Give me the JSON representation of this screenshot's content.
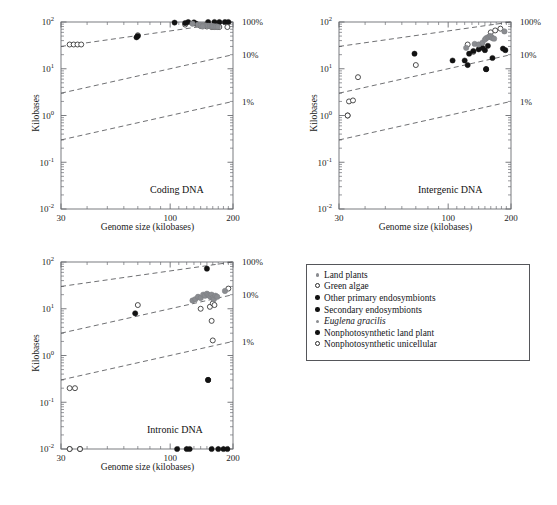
{
  "figure": {
    "background": "#ffffff",
    "axis_color": "#6b6d72",
    "text_color": "#1c1c1c"
  },
  "common": {
    "xlabel": "Genome size (kilobases)",
    "ylabel": "Kilobases",
    "x_ticks": [
      "30",
      "100",
      "200"
    ],
    "x_tick_values": [
      30,
      100,
      200
    ],
    "y_ticks": [
      "10-2",
      "10-1",
      "100",
      "101",
      "102"
    ],
    "y_tick_exponents": [
      "-2",
      "-1",
      "0",
      "1",
      "2"
    ],
    "y_tick_values": [
      0.01,
      0.1,
      1,
      10,
      100
    ],
    "percent_labels": [
      "100%",
      "10%",
      "1%"
    ],
    "percent_values": [
      100,
      10,
      1
    ],
    "xlim": [
      30,
      200
    ],
    "ylim": [
      0.01,
      100
    ],
    "xscale": "log",
    "yscale": "log",
    "grid": false
  },
  "panels": [
    {
      "id": "coding",
      "title": "Coding DNA"
    },
    {
      "id": "intergenic",
      "title": "Intergenic DNA"
    },
    {
      "id": "intronic",
      "title": "Intronic DNA"
    }
  ],
  "legend": {
    "position": "bottom-right",
    "items": [
      {
        "label": "Land plants",
        "marker": "filled-gray-small",
        "color": "#8a8c90"
      },
      {
        "label": "Green algae",
        "marker": "open-circle",
        "color": "#2a2a2a"
      },
      {
        "label": "Other primary endosymbionts",
        "marker": "filled-black",
        "color": "#111111"
      },
      {
        "label": "Secondary endosymbionts",
        "marker": "filled-black",
        "color": "#111111"
      },
      {
        "label": "Euglena gracilis",
        "marker": "filled-gray-small",
        "color": "#8a8c90",
        "italic": true
      },
      {
        "label": "Nonphotosynthetic land plant",
        "marker": "filled-black",
        "color": "#111111"
      },
      {
        "label": "Nonphotosynthetic unicellular",
        "marker": "open-circle",
        "color": "#2a2a2a"
      }
    ]
  },
  "caption": {
    "text": ""
  },
  "chart_data": {
    "type": "scatter",
    "xlabel": "Genome size (kilobases)",
    "ylabel": "Kilobases",
    "xscale": "log",
    "yscale": "log",
    "xlim": [
      30,
      200
    ],
    "ylim": [
      0.01,
      100
    ],
    "grid": false,
    "reference_lines": [
      {
        "label": "100%",
        "fraction": 1.0,
        "style": "dashed"
      },
      {
        "label": "10%",
        "fraction": 0.1,
        "style": "dashed"
      },
      {
        "label": "1%",
        "fraction": 0.01,
        "style": "dashed"
      }
    ],
    "panels": [
      {
        "title": "Coding DNA",
        "series": [
          {
            "name": "Green algae",
            "marker": "open-circle",
            "color": "#2a2a2a",
            "points": [
              [
                33,
                33
              ],
              [
                34.5,
                33
              ],
              [
                36,
                33
              ],
              [
                37.5,
                33
              ],
              [
                70,
                52
              ],
              [
                118,
                88
              ],
              [
                140,
                82
              ],
              [
                150,
                80
              ],
              [
                158,
                78
              ],
              [
                163,
                78
              ],
              [
                168,
                78
              ],
              [
                172,
                78
              ]
            ]
          },
          {
            "name": "Other primary endosymbionts",
            "marker": "filled-black",
            "color": "#111111",
            "points": [
              [
                69,
                47
              ],
              [
                105,
                97
              ],
              [
                122,
                103
              ],
              [
                130,
                98
              ],
              [
                152,
                120
              ],
              [
                163,
                128
              ],
              [
                172,
                130
              ],
              [
                183,
                140
              ],
              [
                190,
                150
              ]
            ]
          },
          {
            "name": "Secondary endosymbionts",
            "marker": "filled-black",
            "color": "#111111",
            "points": [
              [
                118,
                95
              ],
              [
                133,
                92
              ],
              [
                143,
                84
              ],
              [
                148,
                86
              ]
            ]
          },
          {
            "name": "Land plants",
            "marker": "filled-gray-small",
            "color": "#8a8c90",
            "points": [
              [
                128,
                92
              ],
              [
                136,
                88
              ],
              [
                140,
                86
              ],
              [
                144,
                85
              ],
              [
                148,
                84
              ],
              [
                152,
                83
              ],
              [
                155,
                82
              ],
              [
                158,
                82
              ],
              [
                160,
                81
              ],
              [
                163,
                80
              ],
              [
                166,
                80
              ],
              [
                169,
                79
              ]
            ]
          },
          {
            "name": "Euglena gracilis",
            "marker": "filled-gray-small",
            "color": "#8a8c90",
            "points": [
              [
                143,
                80
              ]
            ]
          },
          {
            "name": "Nonphotosynthetic land plant",
            "marker": "filled-black",
            "color": "#111111",
            "points": [
              [
                70,
                50
              ]
            ]
          },
          {
            "name": "Nonphotosynthetic unicellular",
            "marker": "open-circle",
            "color": "#2a2a2a",
            "points": [
              [
                188,
                78
              ]
            ]
          }
        ]
      },
      {
        "title": "Intergenic DNA",
        "series": [
          {
            "name": "Green algae",
            "marker": "open-circle",
            "color": "#2a2a2a",
            "points": [
              [
                33,
                1.0
              ],
              [
                33.5,
                2.0
              ],
              [
                35,
                2.1
              ],
              [
                37,
                6.6
              ],
              [
                70,
                12
              ],
              [
                124,
                33
              ],
              [
                132,
                23
              ],
              [
                160,
                60
              ],
              [
                168,
                66
              ],
              [
                178,
                72
              ]
            ]
          },
          {
            "name": "Other primary endosymbionts",
            "marker": "filled-black",
            "color": "#111111",
            "points": [
              [
                69,
                21
              ],
              [
                105,
                15
              ],
              [
                124,
                12
              ],
              [
                126,
                21
              ],
              [
                140,
                26
              ],
              [
                150,
                25
              ],
              [
                152,
                9.8
              ],
              [
                163,
                17
              ],
              [
                183,
                27
              ],
              [
                188,
                25
              ]
            ]
          },
          {
            "name": "Secondary endosymbionts",
            "marker": "filled-black",
            "color": "#111111",
            "points": [
              [
                120,
                15
              ],
              [
                132,
                24
              ],
              [
                146,
                28
              ],
              [
                155,
                31
              ]
            ]
          },
          {
            "name": "Land plants",
            "marker": "filled-gray-small",
            "color": "#8a8c90",
            "points": [
              [
                122,
                28
              ],
              [
                134,
                34
              ],
              [
                140,
                33
              ],
              [
                146,
                36
              ],
              [
                150,
                42
              ],
              [
                152,
                45
              ],
              [
                155,
                47
              ],
              [
                157,
                48
              ],
              [
                159,
                50
              ],
              [
                161,
                48
              ],
              [
                163,
                45
              ],
              [
                166,
                44
              ]
            ]
          },
          {
            "name": "Euglena gracilis",
            "marker": "filled-gray-small",
            "color": "#8a8c90",
            "points": [
              [
                186,
                63
              ]
            ]
          },
          {
            "name": "Nonphotosynthetic land plant",
            "marker": "filled-black",
            "color": "#111111",
            "points": [
              [
                152,
                9.8
              ]
            ]
          },
          {
            "name": "Nonphotosynthetic unicellular",
            "marker": "open-circle",
            "color": "#2a2a2a",
            "points": [
              [
                33,
                1.0
              ]
            ]
          }
        ]
      },
      {
        "title": "Intronic DNA",
        "series": [
          {
            "name": "Green algae",
            "marker": "open-circle",
            "color": "#2a2a2a",
            "points": [
              [
                33,
                0.2
              ],
              [
                35,
                0.2
              ],
              [
                33,
                0.01
              ],
              [
                37,
                0.01
              ],
              [
                70,
                12
              ],
              [
                140,
                10
              ],
              [
                155,
                11
              ],
              [
                160,
                13
              ],
              [
                163,
                12
              ],
              [
                158,
                5.5
              ],
              [
                160,
                2.1
              ],
              [
                190,
                27
              ]
            ]
          },
          {
            "name": "Other primary endosymbionts",
            "marker": "filled-black",
            "color": "#111111",
            "points": [
              [
                68,
                8.0
              ],
              [
                150,
                72
              ],
              [
                152,
                0.3
              ],
              [
                108,
                0.01
              ],
              [
                120,
                0.01
              ],
              [
                124,
                0.01
              ],
              [
                158,
                0.01
              ],
              [
                170,
                0.01
              ],
              [
                180,
                0.01
              ],
              [
                188,
                0.01
              ]
            ]
          },
          {
            "name": "Land plants",
            "marker": "filled-gray-small",
            "color": "#8a8c90",
            "points": [
              [
                128,
                15
              ],
              [
                132,
                16
              ],
              [
                136,
                18
              ],
              [
                140,
                17
              ],
              [
                144,
                20
              ],
              [
                147,
                19
              ],
              [
                150,
                21
              ],
              [
                152,
                20
              ],
              [
                154,
                19
              ],
              [
                156,
                18
              ],
              [
                158,
                20
              ],
              [
                160,
                17
              ],
              [
                162,
                16
              ],
              [
                165,
                19
              ],
              [
                168,
                18
              ]
            ]
          },
          {
            "name": "Euglena gracilis",
            "marker": "filled-gray-small",
            "color": "#8a8c90",
            "points": [
              [
                183,
                24
              ]
            ]
          },
          {
            "name": "Nonphotosynthetic land plant",
            "marker": "filled-black",
            "color": "#111111",
            "points": [
              [
                152,
                0.3
              ]
            ]
          },
          {
            "name": "Nonphotosynthetic unicellular",
            "marker": "open-circle",
            "color": "#2a2a2a",
            "points": [
              [
                33,
                0.01
              ],
              [
                37,
                0.01
              ]
            ]
          }
        ]
      }
    ]
  }
}
